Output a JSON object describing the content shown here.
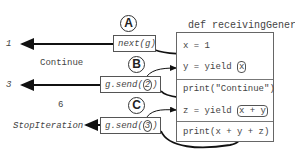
{
  "function_def": "def receivingGenerator():",
  "code_lines": [
    {
      "text": "x = 1"
    },
    {
      "prefix": "y = yield ",
      "highlight": "x",
      "suffix": ""
    },
    {
      "text": "print(\"Continue\")"
    },
    {
      "prefix": "z = yield ",
      "highlight": "x + y",
      "suffix": ""
    },
    {
      "text": "print(x + y + z)"
    }
  ],
  "calls": [
    {
      "label": "A",
      "prefix": "next(g)",
      "arg": "",
      "suffix": "",
      "result": "1"
    },
    {
      "label": "B",
      "prefix": "g.send(",
      "arg": "2",
      "suffix": ")",
      "result": "3"
    },
    {
      "label": "C",
      "prefix": "g.send(",
      "arg": "3",
      "suffix": ")",
      "result": "StopIteration"
    }
  ],
  "printed_outputs": [
    "Continue",
    "6"
  ]
}
